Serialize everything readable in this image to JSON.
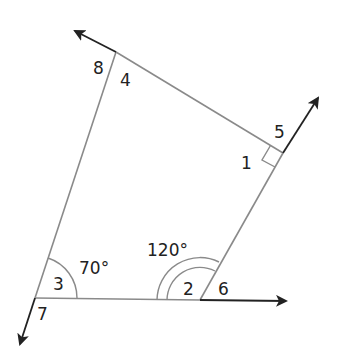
{
  "diagram": {
    "type": "quadrilateral-with-exterior-angles",
    "colors": {
      "side": "#8a8a8a",
      "ray": "#222222",
      "label": "#222222"
    },
    "vertices": {
      "top_left": [
        116,
        52
      ],
      "right": [
        283,
        153
      ],
      "bottom_middle": [
        200,
        300
      ],
      "bottom_left": [
        35,
        298
      ]
    },
    "angle_labels": {
      "a1": "1",
      "a2": "2",
      "a3": "3",
      "a4": "4",
      "a5": "5",
      "a6": "6",
      "a7": "7",
      "a8": "8"
    },
    "given_angles": {
      "bottom_left_interior": "70°",
      "bottom_middle_interior": "120°"
    },
    "marks": {
      "right_angle_at": "right vertex (angle 1)",
      "single_arc_at": "bottom_left (70°)",
      "double_arc_at": "bottom_middle (120°)"
    }
  }
}
